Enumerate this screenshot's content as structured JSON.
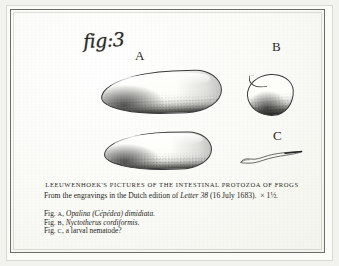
{
  "plate": {
    "handwritten_label": "fig:3",
    "specimen_labels": [
      {
        "id": "A",
        "text": "A"
      },
      {
        "id": "B",
        "text": "B"
      },
      {
        "id": "C",
        "text": "C"
      }
    ],
    "caption": {
      "title": "LEEUWENHOEK'S PICTURES OF THE INTESTINAL PROTOZOA OF FROGS",
      "source_prefix": "From the engravings in the Dutch edition of ",
      "source_italic": "Letter 38",
      "source_suffix": " (16 July 1683).",
      "magnification": "× 1½."
    },
    "legend": [
      {
        "fig_prefix": "Fig.",
        "fig_letter": "A",
        "comma": ",",
        "name_italic": "Opalina (Cépédea) dimidiata",
        "terminator": "."
      },
      {
        "fig_prefix": "Fig.",
        "fig_letter": "B",
        "comma": ",",
        "name_italic": "Nyctotherus cordiformis",
        "terminator": "."
      },
      {
        "fig_prefix": "Fig.",
        "fig_letter": "C",
        "comma": ",",
        "name_plain": "a larval nematode",
        "terminator": "?"
      }
    ],
    "figures": [
      {
        "id": "A-upper",
        "name": "opalina-cepedea-dimidiata-upper",
        "shape": "elongated-teardrop"
      },
      {
        "id": "A-lower",
        "name": "opalina-cepedea-dimidiata-lower",
        "shape": "elongated-teardrop"
      },
      {
        "id": "B",
        "name": "nyctotherus-cordiformis",
        "shape": "rounded-kidney"
      },
      {
        "id": "C",
        "name": "larval-nematode",
        "shape": "thin-squiggle"
      }
    ],
    "colors": {
      "paper": "#fbfbf8",
      "ink": "#262622",
      "frame_rule": "#6e6e68",
      "outer_mat": "#f2f2ee"
    }
  }
}
